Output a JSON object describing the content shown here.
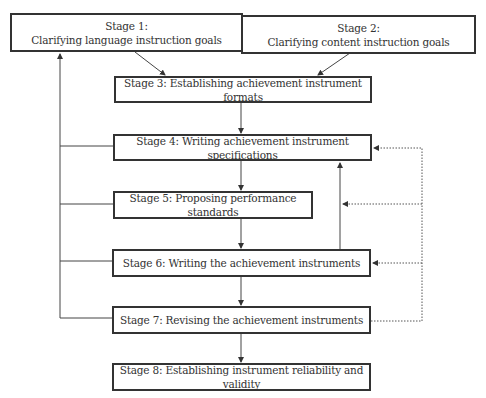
{
  "diagram": {
    "stages": [
      {
        "id": 1,
        "title": "Stage 1:",
        "label": "Clarifying language instruction goals"
      },
      {
        "id": 2,
        "title": "Stage 2:",
        "label": "Clarifying content instruction goals"
      },
      {
        "id": 3,
        "label": "Stage 3: Establishing achievement instrument formats"
      },
      {
        "id": 4,
        "label": "Stage 4: Writing achievement instrument specifications"
      },
      {
        "id": 5,
        "label": "Stage 5: Proposing performance standards"
      },
      {
        "id": 6,
        "label": "Stage 6: Writing the achievement instruments"
      },
      {
        "id": 7,
        "label": "Stage 7: Revising the achievement instruments"
      },
      {
        "id": 8,
        "label": "Stage 8: Establishing instrument reliability and validity"
      }
    ],
    "edges": [
      {
        "from": 1,
        "to": 3,
        "style": "solid"
      },
      {
        "from": 2,
        "to": 3,
        "style": "solid"
      },
      {
        "from": 3,
        "to": 4,
        "style": "solid"
      },
      {
        "from": 4,
        "to": 5,
        "style": "solid"
      },
      {
        "from": 5,
        "to": 6,
        "style": "solid"
      },
      {
        "from": 6,
        "to": 7,
        "style": "solid"
      },
      {
        "from": 7,
        "to": 8,
        "style": "solid"
      },
      {
        "from": 6,
        "to": 4,
        "style": "solid"
      },
      {
        "from": [
          4,
          5,
          6,
          7
        ],
        "to": 1,
        "style": "solid",
        "note": "left feedback line"
      },
      {
        "from": 7,
        "to": [
          4,
          5,
          6
        ],
        "style": "dotted",
        "note": "right feedback line"
      }
    ]
  }
}
